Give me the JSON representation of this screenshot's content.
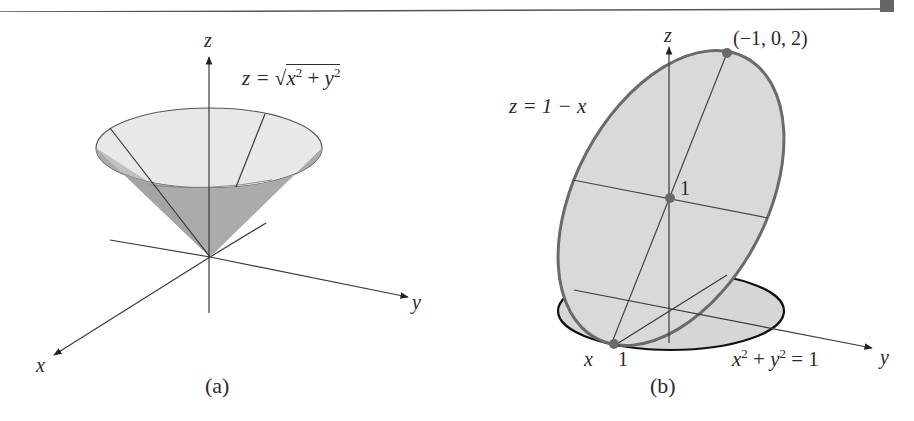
{
  "figure": {
    "panel_a": {
      "caption": "(a)",
      "axis_labels": {
        "x": "x",
        "y": "y",
        "z": "z"
      },
      "equation": {
        "lhs": "z =",
        "radicand_x": "x",
        "exp_x": "2",
        "plus": "+",
        "radicand_y": "y",
        "exp_y": "2"
      },
      "surface": "cone"
    },
    "panel_b": {
      "caption": "(b)",
      "axis_labels": {
        "x": "x",
        "y": "y",
        "z": "z"
      },
      "plane_equation": "z = 1 − x",
      "cylinder_equation": {
        "x": "x",
        "exp_x": "2",
        "plus": "+",
        "y": "y",
        "exp_y": "2",
        "rhs": "= 1"
      },
      "point_top_label": "(−1, 0, 2)",
      "point_center_label": "1",
      "point_bottom_label": "1"
    },
    "colors": {
      "line": "#3a3a3a",
      "cone_inside": "#e6e6e6",
      "cone_outside": "#a9a9a9",
      "ellipse_fill": "#d9d9d9",
      "ellipse_stroke": "#6a6a6a",
      "point": "#6a6a6a",
      "header_rule": "#555555",
      "header_tab": "#666666"
    }
  }
}
